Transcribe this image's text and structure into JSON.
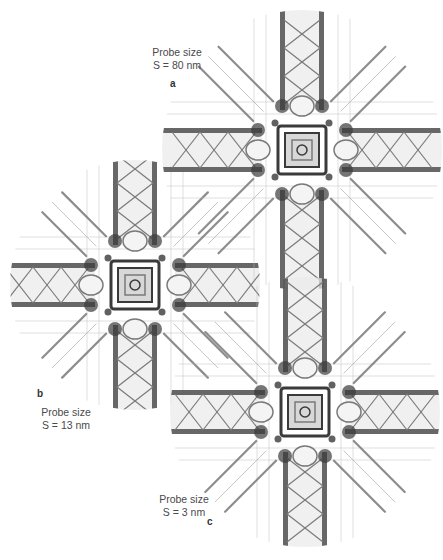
{
  "figure": {
    "panels": [
      {
        "letter": "a",
        "title": "Probe size",
        "value": "S = 80 nm",
        "center": [
          302,
          150
        ],
        "radius": 140
      },
      {
        "letter": "b",
        "title": "Probe size",
        "value": "S = 13 nm",
        "center": [
          135,
          285
        ],
        "radius": 125
      },
      {
        "letter": "c",
        "title": "Probe size",
        "value": "S = 3 nm",
        "center": [
          305,
          412
        ],
        "radius": 135
      }
    ],
    "colors": {
      "ink": "#3a3a3a",
      "mid": "#7a7a7a",
      "light": "#bdbdbd",
      "background": "#ffffff"
    }
  }
}
